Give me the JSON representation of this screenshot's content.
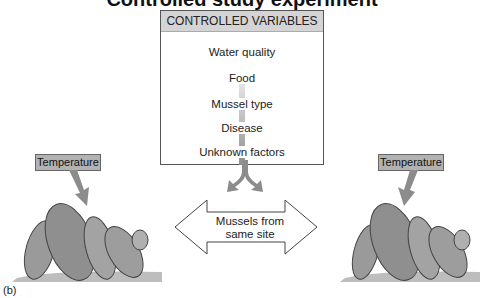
{
  "title_partial": "Controlled study experiment",
  "controlled_variables": {
    "header": "CONTROLLED VARIABLES",
    "items": [
      "Water quality",
      "Food",
      "Mussel type",
      "Disease",
      "Unknown factors"
    ]
  },
  "left_group": {
    "label": "Temperature",
    "subject": "mussels"
  },
  "right_group": {
    "label": "Temperature",
    "subject": "mussels"
  },
  "double_arrow": {
    "line1": "Mussels from",
    "line2": "same site"
  },
  "figure_label": "(b)",
  "colors": {
    "header_bg": "#d4d4d4",
    "label_bg": "#b2b2b2",
    "arrow": "#8c8c8c"
  }
}
